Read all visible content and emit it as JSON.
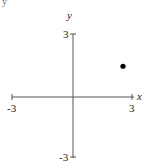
{
  "chart_data": {
    "type": "scatter",
    "title": "",
    "xlabel": "x",
    "ylabel": "y",
    "xlim": [
      -3,
      3
    ],
    "ylim": [
      -3,
      3
    ],
    "x_ticks": [
      "-3",
      "3"
    ],
    "y_ticks": [
      "3",
      "-3"
    ],
    "grid": false,
    "legend": null,
    "series": [
      {
        "name": "point",
        "x": [
          2.5
        ],
        "y": [
          1.5
        ],
        "color": "#000000"
      }
    ]
  },
  "labels": {
    "x_axis": "x",
    "y_axis": "y",
    "x_min": "-3",
    "x_max": "3",
    "y_max": "3",
    "y_min": "-3",
    "corner_fragment": "y"
  },
  "colors": {
    "axis": "#555555",
    "point": "#000000"
  }
}
